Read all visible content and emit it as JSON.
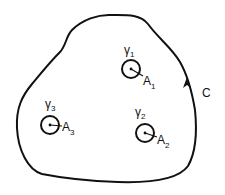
{
  "diagram": {
    "contour": {
      "label": "C",
      "orientation": "counterclockwise",
      "color": "#111111"
    },
    "inner_circles": [
      {
        "name": "γ",
        "sub": "1",
        "point": "A",
        "point_sub": "1"
      },
      {
        "name": "γ",
        "sub": "2",
        "point": "A",
        "point_sub": "2"
      },
      {
        "name": "γ",
        "sub": "3",
        "point": "A",
        "point_sub": "3"
      }
    ]
  }
}
